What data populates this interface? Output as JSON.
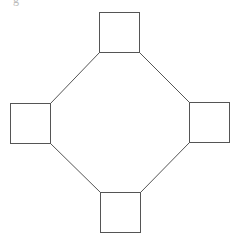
{
  "diagram": {
    "type": "ring-graph",
    "caption_fragment": "g",
    "colors": {
      "stroke": "#555555",
      "node_fill": "#ffffff",
      "background": "#ffffff"
    },
    "nodes": [
      {
        "id": "top",
        "shape": "square",
        "x": 99,
        "y": 12,
        "w": 40,
        "h": 40
      },
      {
        "id": "left",
        "shape": "square",
        "x": 10,
        "y": 103,
        "w": 40,
        "h": 40
      },
      {
        "id": "right",
        "shape": "square",
        "x": 189,
        "y": 102,
        "w": 40,
        "h": 40
      },
      {
        "id": "bottom",
        "shape": "square",
        "x": 100,
        "y": 192,
        "w": 40,
        "h": 40
      }
    ],
    "edges": [
      {
        "from": "top",
        "to": "left",
        "x1": 99,
        "y1": 52,
        "x2": 50,
        "y2": 103
      },
      {
        "from": "top",
        "to": "right",
        "x1": 139,
        "y1": 52,
        "x2": 189,
        "y2": 102
      },
      {
        "from": "left",
        "to": "bottom",
        "x1": 50,
        "y1": 143,
        "x2": 100,
        "y2": 192
      },
      {
        "from": "right",
        "to": "bottom",
        "x1": 189,
        "y1": 142,
        "x2": 140,
        "y2": 192
      }
    ]
  }
}
